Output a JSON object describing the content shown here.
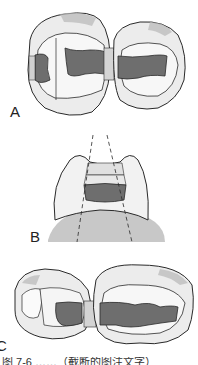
{
  "figure": {
    "panels": [
      {
        "id": "A",
        "label": "A",
        "description": "Occlusal view of two adjacent teeth with connected proximal restorations (dark gray) and matrix bands"
      },
      {
        "id": "B",
        "label": "B",
        "description": "Proximal view of tooth with box preparation and dashed divergence lines"
      },
      {
        "id": "C",
        "label": "C",
        "description": "Occlusal view of premolar and molar with proximal restoration preparations"
      }
    ],
    "caption": "图 7-6 ……（截断的图注文字）",
    "colors": {
      "outline": "#2a2a2a",
      "enamel": "#e8e8e8",
      "shade": "#b8b8b8",
      "restoration": "#6e6e6e",
      "matrix": "#cfcfcf",
      "background": "#ffffff"
    }
  }
}
